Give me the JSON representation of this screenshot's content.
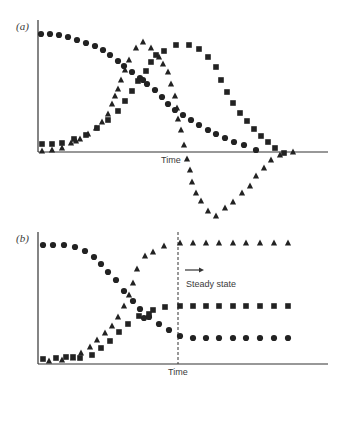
{
  "chart_data": [
    {
      "type": "scatter",
      "panel_label": "(a)",
      "xlabel": "Time",
      "ylabel": "",
      "grid": false,
      "legend": null,
      "axes": {
        "origin_px": [
          38,
          152
        ],
        "x_end_px": 328,
        "y_top_px": 20
      },
      "series": [
        {
          "name": "circles",
          "marker": "circle",
          "points_px": [
            [
              41,
              34
            ],
            [
              50,
              34
            ],
            [
              59,
              35
            ],
            [
              68,
              37
            ],
            [
              77,
              40
            ],
            [
              86,
              43
            ],
            [
              95,
              46
            ],
            [
              103,
              50
            ],
            [
              110,
              55
            ],
            [
              118,
              61
            ],
            [
              124,
              66
            ],
            [
              132,
              72
            ],
            [
              140,
              78
            ],
            [
              143,
              80
            ],
            [
              147,
              84
            ],
            [
              155,
              90
            ],
            [
              162,
              97
            ],
            [
              168,
              104
            ],
            [
              175,
              110
            ],
            [
              183,
              115
            ],
            [
              191,
              120
            ],
            [
              199,
              125
            ],
            [
              208,
              130
            ],
            [
              216,
              134
            ],
            [
              225,
              138
            ],
            [
              234,
              142
            ],
            [
              244,
              145
            ],
            [
              256,
              150
            ]
          ]
        },
        {
          "name": "triangles",
          "marker": "triangle",
          "points_px": [
            [
              42,
              151
            ],
            [
              52,
              150
            ],
            [
              62,
              148
            ],
            [
              71,
              143
            ],
            [
              76,
              141
            ],
            [
              80,
              139
            ],
            [
              88,
              134
            ],
            [
              96,
              128
            ],
            [
              102,
              122
            ],
            [
              108,
              114
            ],
            [
              112,
              104
            ],
            [
              115,
              96
            ],
            [
              118,
              89
            ],
            [
              121,
              80
            ],
            [
              125,
              70
            ],
            [
              129,
              60
            ],
            [
              136,
              48
            ],
            [
              143,
              42
            ],
            [
              151,
              48
            ],
            [
              159,
              57
            ],
            [
              163,
              64
            ],
            [
              168,
              72
            ],
            [
              171,
              84
            ],
            [
              175,
              96
            ],
            [
              177,
              108
            ],
            [
              178,
              119
            ],
            [
              181,
              130
            ],
            [
              184,
              145
            ],
            [
              187,
              159
            ],
            [
              190,
              170
            ],
            [
              192,
              182
            ],
            [
              196,
              193
            ],
            [
              201,
              201
            ],
            [
              208,
              211
            ],
            [
              216,
              216
            ],
            [
              225,
              208
            ],
            [
              233,
              202
            ],
            [
              242,
              193
            ],
            [
              250,
              186
            ],
            [
              256,
              176
            ],
            [
              264,
              168
            ],
            [
              271,
              160
            ],
            [
              280,
              155
            ],
            [
              293,
              152
            ]
          ]
        },
        {
          "name": "squares",
          "marker": "square",
          "points_px": [
            [
              42,
              144
            ],
            [
              52,
              144
            ],
            [
              62,
              143
            ],
            [
              74,
              139
            ],
            [
              86,
              135
            ],
            [
              97,
              128
            ],
            [
              108,
              120
            ],
            [
              118,
              111
            ],
            [
              125,
              101
            ],
            [
              132,
              91
            ],
            [
              138,
              81
            ],
            [
              146,
              71
            ],
            [
              151,
              62
            ],
            [
              156,
              55
            ],
            [
              164,
              51
            ],
            [
              176,
              45
            ],
            [
              189,
              45
            ],
            [
              199,
              49
            ],
            [
              208,
              57
            ],
            [
              216,
              67
            ],
            [
              221,
              80
            ],
            [
              227,
              92
            ],
            [
              233,
              103
            ],
            [
              240,
              113
            ],
            [
              247,
              121
            ],
            [
              254,
              129
            ],
            [
              261,
              136
            ],
            [
              268,
              142
            ],
            [
              275,
              148
            ],
            [
              284,
              153
            ]
          ]
        }
      ]
    },
    {
      "type": "scatter",
      "panel_label": "(b)",
      "xlabel": "Time",
      "ylabel": "",
      "grid": false,
      "legend": null,
      "annotation": {
        "text": "Steady state",
        "arrow": "right",
        "divider_x_px": 178
      },
      "axes": {
        "origin_px": [
          38,
          364
        ],
        "x_end_px": 328,
        "y_top_px": 232
      },
      "series": [
        {
          "name": "circles",
          "marker": "circle",
          "points_px": [
            [
              43,
              245
            ],
            [
              53,
              245
            ],
            [
              64,
              245
            ],
            [
              75,
              247
            ],
            [
              85,
              251
            ],
            [
              94,
              257
            ],
            [
              101,
              264
            ],
            [
              108,
              272
            ],
            [
              116,
              280
            ],
            [
              124,
              291
            ],
            [
              133,
              301
            ],
            [
              140,
              309
            ],
            [
              144,
              318
            ],
            [
              149,
              317
            ],
            [
              159,
              324
            ],
            [
              169,
              330
            ],
            [
              180,
              336
            ],
            [
              193,
              338
            ],
            [
              206,
              338
            ],
            [
              219,
              338
            ],
            [
              233,
              338
            ],
            [
              246,
              338
            ],
            [
              260,
              338
            ],
            [
              274,
              338
            ],
            [
              288,
              338
            ]
          ]
        },
        {
          "name": "triangles",
          "marker": "triangle",
          "points_px": [
            [
              49,
              361
            ],
            [
              62,
              360
            ],
            [
              73,
              358
            ],
            [
              81,
              353
            ],
            [
              90,
              347
            ],
            [
              97,
              340
            ],
            [
              105,
              333
            ],
            [
              112,
              326
            ],
            [
              118,
              317
            ],
            [
              124,
              306
            ],
            [
              129,
              295
            ],
            [
              133,
              283
            ],
            [
              137,
              269
            ],
            [
              145,
              256
            ],
            [
              153,
              252
            ],
            [
              164,
              246
            ],
            [
              180,
              243
            ],
            [
              193,
              243
            ],
            [
              206,
              243
            ],
            [
              219,
              243
            ],
            [
              233,
              243
            ],
            [
              246,
              243
            ],
            [
              260,
              243
            ],
            [
              274,
              243
            ],
            [
              288,
              243
            ]
          ]
        },
        {
          "name": "squares",
          "marker": "square",
          "points_px": [
            [
              43,
              359
            ],
            [
              56,
              358
            ],
            [
              66,
              357
            ],
            [
              73,
              357
            ],
            [
              80,
              358
            ],
            [
              92,
              355
            ],
            [
              101,
              348
            ],
            [
              110,
              341
            ],
            [
              119,
              332
            ],
            [
              128,
              324
            ],
            [
              139,
              316
            ],
            [
              149,
              314
            ],
            [
              153,
              310
            ],
            [
              165,
              307
            ],
            [
              180,
              306
            ],
            [
              193,
              306
            ],
            [
              206,
              306
            ],
            [
              219,
              306
            ],
            [
              233,
              306
            ],
            [
              246,
              306
            ],
            [
              260,
              306
            ],
            [
              274,
              306
            ],
            [
              288,
              306
            ]
          ]
        }
      ]
    }
  ],
  "labels": {
    "panel_a": "(a)",
    "panel_b": "(b)",
    "time_a": "Time",
    "time_b": "Time",
    "steady_state": "Steady state"
  },
  "colors": {
    "ink": "#222222",
    "axis": "#333333"
  }
}
